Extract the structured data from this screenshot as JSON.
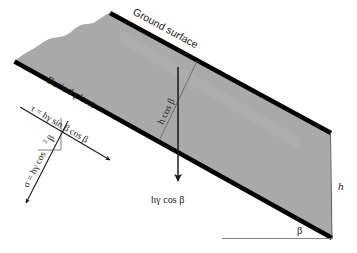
{
  "figure": {
    "type": "geotechnical-diagram",
    "background_color": "#ffffff",
    "slab_fill_color": "#a8a8a8",
    "slab_edge_color": "#000000",
    "line_color": "#1a1a1a",
    "text_color": "#1a1a1a"
  },
  "labels": {
    "ground_surface": "Ground surface",
    "buried_plane": "Buried plane",
    "shear_stress": "τ = hγ sin β cos β",
    "normal_stress_sigma": "σ = hγ cos",
    "normal_stress_exponent": "2",
    "normal_stress_beta": "β",
    "vertical_stress": "hγ cos β",
    "vertical_height": "h cos β",
    "depth": "h",
    "slope_angle": "β"
  },
  "geometry": {
    "ground_surface_line": "from (110,13) to (330,133)",
    "buried_plane_line": "from (14,62) to (332,238)",
    "right_edge": "from (330,133) to (332,238)",
    "horizontal_reference": "from (222,238) to (332,238)",
    "vertical_arrow": "from (178,68) to (178,185)",
    "perpendicular_line": "from (196,62) to (160,140)",
    "tau_arrow": "from (20,108) to (112,162)",
    "sigma_arrow": "from (68,122) to (24,206)"
  }
}
